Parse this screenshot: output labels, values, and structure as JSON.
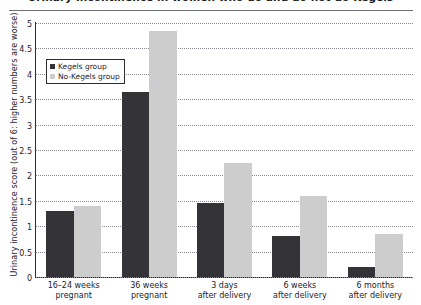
{
  "chart_data": {
    "type": "bar",
    "title": "Urinary incontinence in women who do and do not do Kegels",
    "xlabel": "",
    "ylabel": "Urinary incontinence score (out of 6: higher numbers are worse)",
    "ylim": [
      0,
      5
    ],
    "ytick_step": 0.5,
    "yticks": [
      "5",
      "4.5",
      "4",
      "3.5",
      "3",
      "2.5",
      "2",
      "1.5",
      "1",
      "0.5",
      "0"
    ],
    "ytick_values": [
      5,
      4.5,
      4,
      3.5,
      3,
      2.5,
      2,
      1.5,
      1,
      0.5,
      0
    ],
    "grid": true,
    "legend_position": "upper-left-inside",
    "categories": [
      "16–24 weeks pregnant",
      "36 weeks pregnant",
      "3 days after delivery",
      "6 weeks after delivery",
      "6 months after delivery"
    ],
    "category_lines": [
      [
        "16–24 weeks",
        "pregnant"
      ],
      [
        "36 weeks",
        "pregnant"
      ],
      [
        "3 days",
        "after delivery"
      ],
      [
        "6 weeks",
        "after delivery"
      ],
      [
        "6 months",
        "after delivery"
      ]
    ],
    "series": [
      {
        "name": "Kegels group",
        "color": "#333338",
        "values": [
          1.3,
          3.65,
          1.45,
          0.8,
          0.2
        ]
      },
      {
        "name": "No-Kegels group",
        "color": "#cdcdcd",
        "values": [
          1.4,
          4.85,
          2.25,
          1.6,
          0.85
        ]
      }
    ]
  },
  "legend": {
    "items": [
      {
        "label": "Kegels group",
        "color": "#333338"
      },
      {
        "label": "No-Kegels group",
        "color": "#cdcdcd"
      }
    ]
  }
}
